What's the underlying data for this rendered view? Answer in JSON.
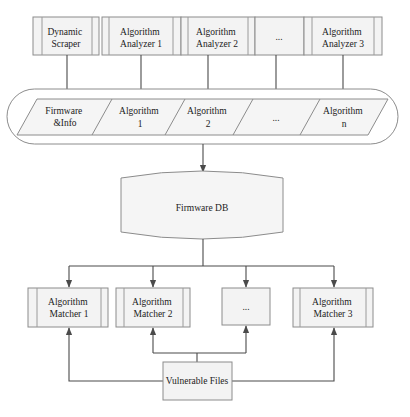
{
  "diagram": {
    "analyzers": [
      {
        "lines": [
          "Dynamic",
          "Scraper"
        ]
      },
      {
        "lines": [
          "Algorithm",
          "Analyzer 1"
        ]
      },
      {
        "lines": [
          "Algorithm",
          "Analyzer 2"
        ]
      },
      {
        "lines": [
          "..."
        ]
      },
      {
        "lines": [
          "Algorithm",
          "Analyzer 3"
        ]
      }
    ],
    "storage_row": [
      {
        "lines": [
          "Firmware",
          "&Info"
        ]
      },
      {
        "lines": [
          "Algorithm",
          "1"
        ]
      },
      {
        "lines": [
          "Algorithm",
          "2"
        ]
      },
      {
        "lines": [
          "..."
        ]
      },
      {
        "lines": [
          "Algorithm",
          "n"
        ]
      }
    ],
    "database": {
      "label": "Firmware DB"
    },
    "matchers": [
      {
        "lines": [
          "Algorithm",
          "Matcher 1"
        ]
      },
      {
        "lines": [
          "Algorithm",
          "Matcher 2"
        ]
      },
      {
        "lines": [
          "..."
        ]
      },
      {
        "lines": [
          "Algorithm",
          "Matcher 3"
        ]
      }
    ],
    "source": {
      "label": "Vulnerable Files"
    },
    "connections": [
      {
        "from": "Dynamic Scraper",
        "to": "Firmware &Info"
      },
      {
        "from": "Algorithm Analyzer 1",
        "to": "Algorithm 1"
      },
      {
        "from": "Algorithm Analyzer 2",
        "to": "Algorithm 2"
      },
      {
        "from": "...",
        "to": "..."
      },
      {
        "from": "Algorithm Analyzer 3",
        "to": "Algorithm n"
      },
      {
        "from": "Storage row",
        "to": "Firmware DB"
      },
      {
        "from": "Firmware DB",
        "to": "Algorithm Matcher 1"
      },
      {
        "from": "Firmware DB",
        "to": "Algorithm Matcher 2"
      },
      {
        "from": "Firmware DB",
        "to": "..."
      },
      {
        "from": "Firmware DB",
        "to": "Algorithm Matcher 3"
      },
      {
        "from": "Vulnerable Files",
        "to": "Algorithm Matcher 1"
      },
      {
        "from": "Vulnerable Files",
        "to": "Algorithm Matcher 2"
      },
      {
        "from": "Vulnerable Files",
        "to": "..."
      },
      {
        "from": "Vulnerable Files",
        "to": "Algorithm Matcher 3"
      }
    ],
    "colors": {
      "box_fill": "#f3f3f3",
      "box_border": "#8c8c8c",
      "edge": "#4a4a4a",
      "text": "#222222"
    }
  }
}
